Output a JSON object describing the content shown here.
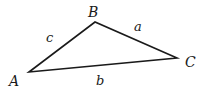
{
  "diagram": {
    "type": "triangle",
    "vertices": [
      {
        "name": "A",
        "x": 29,
        "y": 72
      },
      {
        "name": "B",
        "x": 95,
        "y": 22
      },
      {
        "name": "C",
        "x": 177,
        "y": 58
      }
    ],
    "sides": [
      {
        "name": "a",
        "from": "B",
        "to": "C"
      },
      {
        "name": "b",
        "from": "A",
        "to": "C"
      },
      {
        "name": "c",
        "from": "A",
        "to": "B"
      }
    ],
    "labels": {
      "vertex_A": "A",
      "vertex_B": "B",
      "vertex_C": "C",
      "side_a": "a",
      "side_b": "b",
      "side_c": "c"
    },
    "stroke_color": "#1a1a1a"
  }
}
